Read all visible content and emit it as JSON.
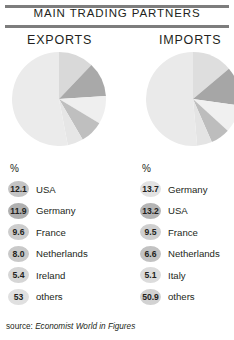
{
  "header": {
    "title": "MAIN TRADING PARTNERS"
  },
  "columns": [
    {
      "id": "exports",
      "heading": "EXPORTS",
      "unit_label": "%",
      "rows": [
        {
          "value": "12.1",
          "name": "USA",
          "shade": "#c4c4c4"
        },
        {
          "value": "11.9",
          "name": "Germany",
          "shade": "#b0b0b0"
        },
        {
          "value": "9.6",
          "name": "France",
          "shade": "#cdcdcd"
        },
        {
          "value": "8.0",
          "name": "Netherlands",
          "shade": "#c9c9c9"
        },
        {
          "value": "5.4",
          "name": "Ireland",
          "shade": "#d6d6d6"
        },
        {
          "value": "53",
          "name": "others",
          "shade": "#e0e0e0"
        }
      ]
    },
    {
      "id": "imports",
      "heading": "IMPORTS",
      "unit_label": "%",
      "rows": [
        {
          "value": "13.7",
          "name": "Germany",
          "shade": "#e2e2e2"
        },
        {
          "value": "13.2",
          "name": "USA",
          "shade": "#b4b4b4"
        },
        {
          "value": "9.5",
          "name": "France",
          "shade": "#cfcfcf"
        },
        {
          "value": "6.6",
          "name": "Netherlands",
          "shade": "#c2c2c2"
        },
        {
          "value": "5.1",
          "name": "Italy",
          "shade": "#dcdcdc"
        },
        {
          "value": "50.9",
          "name": "others",
          "shade": "#d2d2d2"
        }
      ]
    }
  ],
  "source": {
    "label": "source:",
    "publication": "Economist World in Figures"
  },
  "chart_data": [
    {
      "type": "pie",
      "title": "EXPORTS",
      "labels": [
        "USA",
        "Germany",
        "France",
        "Netherlands",
        "Ireland",
        "others"
      ],
      "values": [
        12.1,
        11.9,
        9.6,
        8.0,
        5.4,
        53
      ],
      "unit": "%",
      "colors": [
        "#d9d9d9",
        "#a9a9a9",
        "#efefef",
        "#bfbfbf",
        "#e6e6e6",
        "#ebebeb"
      ],
      "start_angle_deg": 0,
      "direction": "clockwise",
      "legend": "right-of-slice-list",
      "grid": false
    },
    {
      "type": "pie",
      "title": "IMPORTS",
      "labels": [
        "Germany",
        "USA",
        "France",
        "Netherlands",
        "Italy",
        "others"
      ],
      "values": [
        13.7,
        13.2,
        9.5,
        6.6,
        5.1,
        50.9
      ],
      "unit": "%",
      "colors": [
        "#dedede",
        "#a6a6a6",
        "#f0f0f0",
        "#bdbdbd",
        "#e4e4e4",
        "#eaeaea"
      ],
      "start_angle_deg": 0,
      "direction": "clockwise",
      "legend": "right-of-slice-list",
      "grid": false
    }
  ]
}
